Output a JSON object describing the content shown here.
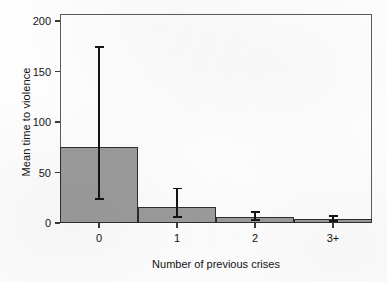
{
  "chart_data": {
    "type": "bar",
    "title": "",
    "subtitle": "",
    "xlabel": "Number of previous crises",
    "ylabel": "Mean time to violence",
    "categories": [
      "0",
      "1",
      "2",
      "3+"
    ],
    "values": [
      75,
      16,
      6,
      4
    ],
    "series": [
      {
        "name": "Mean time to violence",
        "values": [
          75,
          16,
          6,
          4
        ],
        "error_low": [
          23,
          5,
          2,
          1
        ],
        "error_high": [
          175,
          35,
          12,
          8
        ]
      }
    ],
    "error_bars": [
      {
        "category": "0",
        "low": 23,
        "high": 175
      },
      {
        "category": "1",
        "low": 5,
        "high": 35
      },
      {
        "category": "2",
        "low": 2,
        "high": 12
      },
      {
        "category": "3+",
        "low": 1,
        "high": 8
      }
    ],
    "ylim": [
      0,
      207
    ],
    "yticks": [
      0,
      50,
      100,
      150,
      200
    ],
    "yticklabels": [
      "0",
      "50",
      "100",
      "150",
      "200"
    ],
    "xticklabels": [
      "0",
      "1",
      "2",
      "3+"
    ],
    "grid": false,
    "legend": null,
    "legend_position": "none",
    "bar_fill_color": "#9b9b9b",
    "bar_edge_color": "#2e2e2e",
    "error_bar_color": "#141414",
    "axis_color": "#3a3a3a",
    "background_color": "#ffffff"
  }
}
